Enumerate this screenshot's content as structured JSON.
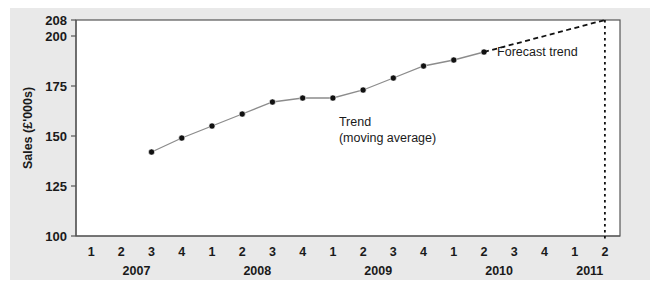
{
  "chart_data": {
    "type": "line",
    "title": "",
    "xlabel": "",
    "ylabel": "Sales (£'000s)",
    "ylim": [
      100,
      208
    ],
    "yticks": [
      100,
      125,
      150,
      175,
      200,
      208
    ],
    "ytick_labels": [
      "100",
      "125",
      "150",
      "175",
      "200",
      "208"
    ],
    "grid": false,
    "legend": "none",
    "x": [
      "2007 Q1",
      "2007 Q2",
      "2007 Q3",
      "2007 Q4",
      "2008 Q1",
      "2008 Q2",
      "2008 Q3",
      "2008 Q4",
      "2009 Q1",
      "2009 Q2",
      "2009 Q3",
      "2009 Q4",
      "2010 Q1",
      "2010 Q2",
      "2010 Q3",
      "2010 Q4",
      "2011 Q1",
      "2011 Q2"
    ],
    "quarter_labels": [
      "1",
      "2",
      "3",
      "4",
      "1",
      "2",
      "3",
      "4",
      "1",
      "2",
      "3",
      "4",
      "1",
      "2",
      "3",
      "4",
      "1",
      "2"
    ],
    "year_groups": [
      {
        "label": "2007",
        "start_index": 0,
        "end_index": 3
      },
      {
        "label": "2008",
        "start_index": 4,
        "end_index": 7
      },
      {
        "label": "2009",
        "start_index": 8,
        "end_index": 11
      },
      {
        "label": "2010",
        "start_index": 12,
        "end_index": 15
      },
      {
        "label": "2011",
        "start_index": 16,
        "end_index": 17
      }
    ],
    "series": [
      {
        "name": "Trend (moving average)",
        "style": "solid-with-markers",
        "color": "#8c8c8c",
        "marker_color": "#111111",
        "points": [
          {
            "x": "2007 Q3",
            "x_index": 2,
            "y": 142
          },
          {
            "x": "2007 Q4",
            "x_index": 3,
            "y": 149
          },
          {
            "x": "2008 Q1",
            "x_index": 4,
            "y": 155
          },
          {
            "x": "2008 Q2",
            "x_index": 5,
            "y": 161
          },
          {
            "x": "2008 Q3",
            "x_index": 6,
            "y": 167
          },
          {
            "x": "2008 Q4",
            "x_index": 7,
            "y": 169
          },
          {
            "x": "2009 Q1",
            "x_index": 8,
            "y": 169
          },
          {
            "x": "2009 Q2",
            "x_index": 9,
            "y": 173
          },
          {
            "x": "2009 Q3",
            "x_index": 10,
            "y": 179
          },
          {
            "x": "2009 Q4",
            "x_index": 11,
            "y": 185
          },
          {
            "x": "2010 Q1",
            "x_index": 12,
            "y": 188
          },
          {
            "x": "2010 Q2",
            "x_index": 13,
            "y": 192
          }
        ]
      },
      {
        "name": "Forecast trend",
        "style": "dashed",
        "color": "#111111",
        "points": [
          {
            "x": "2010 Q2",
            "x_index": 13,
            "y": 192
          },
          {
            "x": "2011 Q2",
            "x_index": 17,
            "y": 208
          }
        ]
      }
    ],
    "annotations": [
      {
        "name": "trend-annotation",
        "line1": "Trend",
        "line2": "(moving average)",
        "x_index": 8.2,
        "y": 155
      },
      {
        "name": "forecast-annotation",
        "line1": "Forecast trend",
        "x_index": 16.1,
        "y": 190
      }
    ],
    "reference_lines": [
      {
        "name": "forecast-endpoint-vertical",
        "orientation": "vertical",
        "x_index": 17,
        "style": "dotted",
        "color": "#111111"
      }
    ]
  }
}
